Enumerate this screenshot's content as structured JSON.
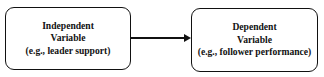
{
  "nodes": [
    {
      "id": "independent",
      "lines": [
        "Independent",
        "Variable",
        "(e.g., leader support)"
      ]
    },
    {
      "id": "dependent",
      "lines": [
        "Dependent",
        "Variable",
        "(e.g., follower performance)"
      ]
    }
  ],
  "edges": [
    {
      "from": "independent",
      "to": "dependent",
      "type": "arrow"
    }
  ],
  "colors": {
    "stroke": "#111111",
    "background": "#ffffff"
  }
}
